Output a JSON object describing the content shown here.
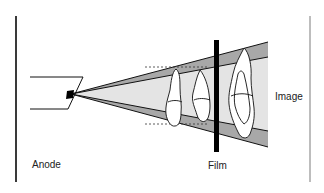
{
  "diagram": {
    "labels": {
      "anode": "Anode",
      "film": "Film",
      "image": "Image"
    },
    "colors": {
      "frame_dark": "#3a3a3a",
      "frame_light": "#b5b5b5",
      "beam_outer": "#a6a6a6",
      "beam_inner": "#e4e4e4",
      "line": "#111111",
      "film": "#000000",
      "tooth_fill": "#ffffff"
    },
    "elements": [
      "anode-source",
      "focal-spot",
      "x-ray-beam-cone",
      "penumbra-bands",
      "teeth",
      "film",
      "projection-dashes"
    ]
  }
}
